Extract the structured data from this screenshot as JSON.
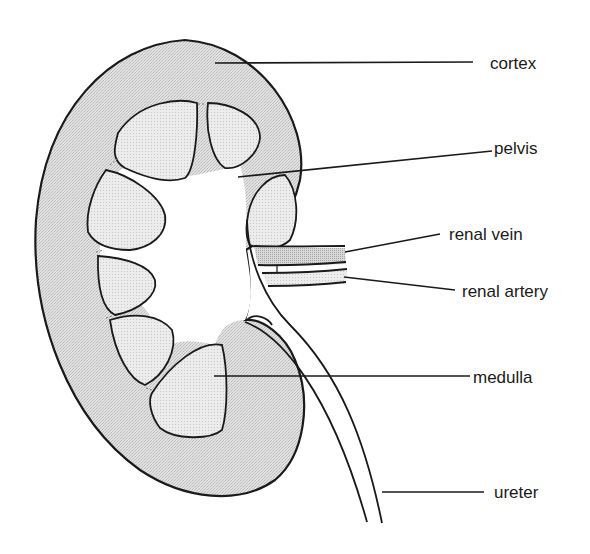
{
  "diagram": {
    "labels": [
      {
        "id": "cortex",
        "text": "cortex"
      },
      {
        "id": "pelvis",
        "text": "pelvis"
      },
      {
        "id": "renal-vein",
        "text": "renal vein"
      },
      {
        "id": "renal-artery",
        "text": "renal artery"
      },
      {
        "id": "medulla",
        "text": "medulla"
      },
      {
        "id": "ureter",
        "text": "ureter"
      }
    ],
    "colors": {
      "outline": "#1a1a1a",
      "cortex_fill": "#d9d9d9",
      "medulla_fill": "#e6e6e6",
      "vein_fill": "#cfcfcf",
      "artery_fill": "#e3e3e3",
      "background": "#ffffff"
    }
  }
}
